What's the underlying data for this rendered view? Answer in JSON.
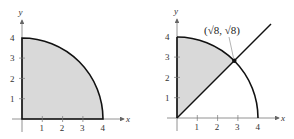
{
  "figures": [
    {
      "id": "left",
      "description": "Quarter disk of radius 4 in first quadrant, shaded",
      "axis_labels": {
        "x": "x",
        "y": "y"
      },
      "x_ticks": [
        "1",
        "2",
        "3",
        "4"
      ],
      "y_ticks": [
        "1",
        "2",
        "3",
        "4"
      ],
      "region": "x^2 + y^2 <= 16, x >= 0, y >= 0",
      "colors": {
        "fill": "#d9d9d9",
        "stroke": "#111111",
        "axis": "#555555"
      }
    },
    {
      "id": "right",
      "description": "Quarter circle of radius 4 with line y = x; shaded region between y-axis, line y=x and arc",
      "axis_labels": {
        "x": "x",
        "y": "y"
      },
      "x_ticks": [
        "1",
        "2",
        "3",
        "4"
      ],
      "y_ticks": [
        "1",
        "2",
        "3",
        "4"
      ],
      "intersection_label": "(√8, √8)",
      "intersection_point": [
        2.828,
        2.828
      ],
      "colors": {
        "fill": "#d9d9d9",
        "stroke": "#111111",
        "axis": "#555555"
      }
    }
  ]
}
